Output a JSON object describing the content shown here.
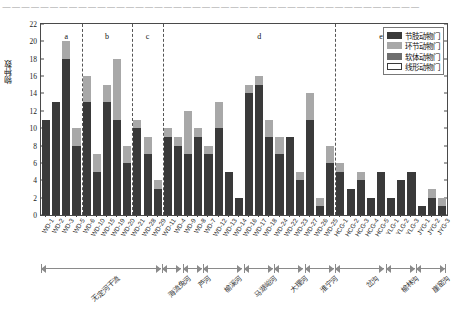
{
  "page": {
    "top_text": "————————————————————————————————————————————",
    "caption_hidden": ""
  },
  "chart_data": {
    "type": "bar",
    "stacked": true,
    "title": "",
    "xlabel": "",
    "ylabel": "物种数",
    "ylim": [
      0,
      22
    ],
    "yticks": [
      0,
      2,
      4,
      6,
      8,
      10,
      12,
      14,
      16,
      18,
      20,
      22
    ],
    "grid": false,
    "legend_position": "top-right",
    "legend": [
      "节肢动物门",
      "环节动物门",
      "软体动物门",
      "线形动物门"
    ],
    "colors": {
      "节肢动物门": "#3a3a3a",
      "环节动物门": "#a8a8a8",
      "软体动物门": "#6e6e6e",
      "线形动物门": "#ffffff"
    },
    "categories": [
      "WD-1",
      "WD-2",
      "WD-3",
      "WD-5",
      "WD-6",
      "WD-10",
      "WD-15",
      "WD-19",
      "WD-20",
      "WD-21",
      "WD-28",
      "WD-29",
      "WD-11",
      "WD-4",
      "WD-9",
      "WD-8",
      "WD-7",
      "WD-12",
      "WD-13",
      "WD-14",
      "WD-16",
      "WD-17",
      "WD-18",
      "WD-24",
      "WD-22",
      "WD-23",
      "WD-27",
      "WD-26",
      "WD-25",
      "HCG-1",
      "HCG-2",
      "HCG-3",
      "HCG-4",
      "HCG-5",
      "YLG-1",
      "YLG-2",
      "YLG-3",
      "JYG-1",
      "JYG-2",
      "JYG-3"
    ],
    "series": [
      {
        "name": "节肢动物门",
        "values": [
          11,
          13,
          18,
          8,
          13,
          5,
          13,
          11,
          6,
          10,
          7,
          3,
          9,
          8,
          7,
          9,
          7,
          10,
          5,
          2,
          14,
          15,
          9,
          7,
          9,
          4,
          11,
          1,
          6,
          5,
          3,
          4,
          2,
          5,
          2,
          4,
          5,
          1,
          2,
          1
        ]
      },
      {
        "name": "环节动物门",
        "values": [
          0,
          0,
          2,
          2,
          3,
          2,
          2,
          7,
          2,
          1,
          2,
          1,
          1,
          1,
          5,
          1,
          1,
          3,
          0,
          0,
          1,
          1,
          2,
          2,
          0,
          1,
          3,
          1,
          2,
          1,
          0,
          1,
          0,
          0,
          0,
          0,
          0,
          0,
          1,
          1
        ]
      },
      {
        "name": "软体动物门",
        "values": [
          0,
          0,
          0,
          0,
          0,
          0,
          0,
          0,
          0,
          0,
          0,
          0,
          0,
          0,
          0,
          0,
          0,
          0,
          0,
          0,
          0,
          0,
          0,
          0,
          0,
          0,
          0,
          0,
          0,
          0,
          0,
          0,
          0,
          0,
          0,
          0,
          0,
          0,
          0,
          0
        ]
      },
      {
        "name": "线形动物门",
        "values": [
          0,
          0,
          0,
          0,
          0,
          0,
          0,
          0,
          0,
          0,
          0,
          0,
          0,
          0,
          0,
          0,
          0,
          0,
          0,
          0,
          0,
          0,
          0,
          0,
          0,
          0,
          0,
          0,
          0,
          0,
          0,
          0,
          0,
          0,
          0,
          0,
          0,
          0,
          0,
          0
        ]
      }
    ],
    "totals": [
      11,
      13,
      20,
      10,
      16,
      7,
      15,
      18,
      8,
      11,
      9,
      4,
      10,
      9,
      12,
      10,
      8,
      13,
      5,
      2,
      15,
      16,
      11,
      9,
      9,
      5,
      14,
      2,
      8,
      6,
      3,
      5,
      2,
      5,
      2,
      4,
      5,
      1,
      3,
      2
    ],
    "section_letters": [
      {
        "label": "a",
        "at_index": 2
      },
      {
        "label": "b",
        "at_index": 6
      },
      {
        "label": "c",
        "at_index": 10
      },
      {
        "label": "d",
        "at_index": 21
      },
      {
        "label": "e",
        "at_index": 33
      }
    ],
    "dividers_after_index": [
      3,
      8,
      11,
      28
    ],
    "groups": [
      {
        "name": "无定河干流",
        "start": 0,
        "end": 11
      },
      {
        "name": "海流兔河",
        "start": 12,
        "end": 13
      },
      {
        "name": "芦河",
        "start": 14,
        "end": 15
      },
      {
        "name": "榆溪河",
        "start": 16,
        "end": 19
      },
      {
        "name": "马湖峪河",
        "start": 20,
        "end": 22
      },
      {
        "name": "大理河",
        "start": 23,
        "end": 25
      },
      {
        "name": "淮宁河",
        "start": 26,
        "end": 28
      },
      {
        "name": "岔沟",
        "start": 29,
        "end": 33
      },
      {
        "name": "榆林沟",
        "start": 34,
        "end": 36
      },
      {
        "name": "崖窑沟",
        "start": 37,
        "end": 39
      }
    ]
  }
}
